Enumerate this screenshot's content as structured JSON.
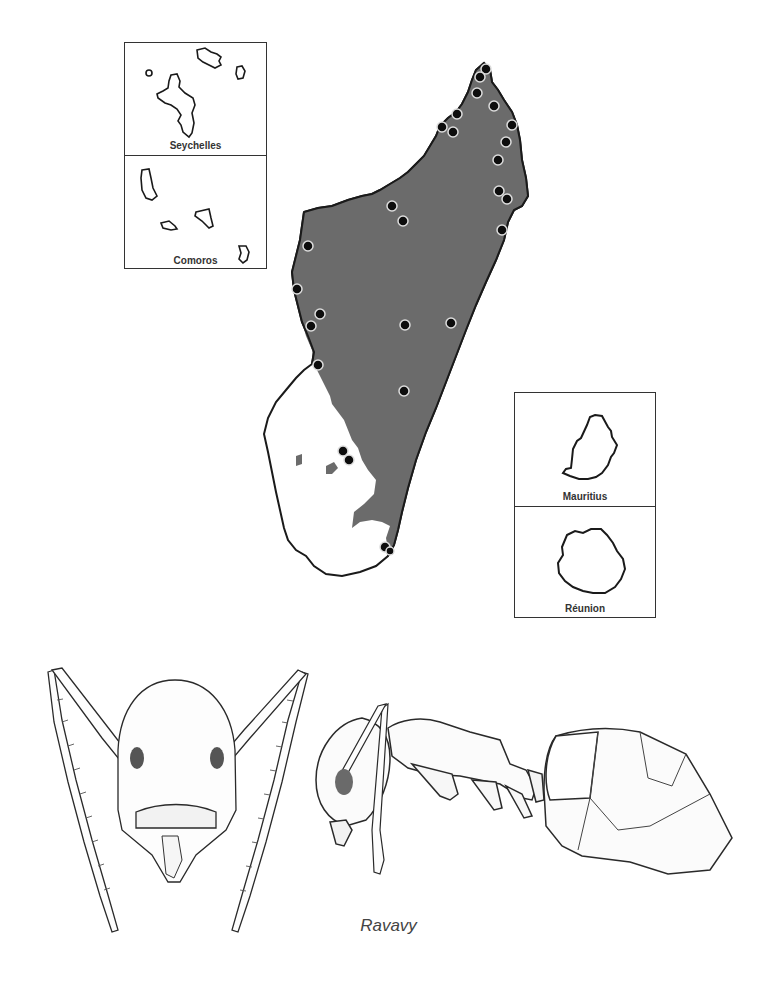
{
  "figure": {
    "genus_caption": "Ravavy",
    "colors": {
      "range_fill": "#6b6b6b",
      "coastline": "#1a1a1a",
      "dot_fill": "#0d0d0d",
      "dot_ring": "#dddddd",
      "inset_border": "#333333"
    }
  },
  "insets": [
    {
      "label": "Seychelles",
      "position": "top-left upper"
    },
    {
      "label": "Comoros",
      "position": "top-left lower"
    },
    {
      "label": "Mauritius",
      "position": "right upper"
    },
    {
      "label": "Réunion",
      "position": "right lower"
    }
  ],
  "main_map": {
    "region": "Madagascar",
    "legend": "Shaded area = known range; black dots = collection localities",
    "localities_count": 30
  },
  "illustrations": [
    {
      "view": "head-frontal"
    },
    {
      "view": "body-lateral"
    }
  ]
}
